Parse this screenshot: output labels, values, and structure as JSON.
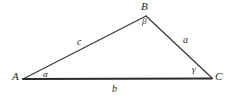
{
  "figure": {
    "type": "geometry-diagram",
    "background_color": "#ffffff",
    "stroke_color": "#3a3a3a",
    "base_stroke_color": "#2b2b2b",
    "text_color": "#231f20",
    "width": 231,
    "height": 99
  },
  "vertices": [
    {
      "id": "A",
      "label": "A",
      "x": 23,
      "y": 79
    },
    {
      "id": "B",
      "label": "B",
      "x": 146,
      "y": 16
    },
    {
      "id": "C",
      "label": "C",
      "x": 212,
      "y": 78
    }
  ],
  "sides": [
    {
      "id": "c",
      "label": "c",
      "from": "A",
      "to": "B"
    },
    {
      "id": "a",
      "label": "a",
      "from": "B",
      "to": "C"
    },
    {
      "id": "b",
      "label": "b",
      "from": "A",
      "to": "C"
    }
  ],
  "angles": [
    {
      "id": "alpha",
      "label": "α",
      "at_vertex": "A"
    },
    {
      "id": "beta",
      "label": "β",
      "at_vertex": "B"
    },
    {
      "id": "gamma",
      "label": "γ",
      "at_vertex": "C"
    }
  ]
}
